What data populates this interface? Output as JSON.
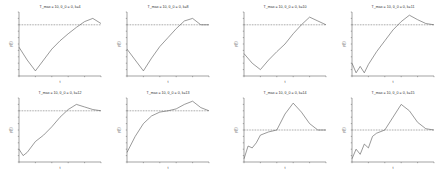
{
  "figure": {
    "rows": 2,
    "cols": 4
  },
  "chart_data": [
    {
      "type": "line",
      "title": "T_max = 10, θ_0 = 0, k=4",
      "xlabel": "t",
      "ylabel": "p(t)",
      "threshold": 0.8,
      "x": [
        0,
        0.1,
        0.2,
        0.3,
        0.4,
        0.5,
        0.6,
        0.7,
        0.8,
        0.9,
        1.0
      ],
      "values": [
        0.45,
        0.25,
        0.08,
        0.25,
        0.42,
        0.55,
        0.66,
        0.76,
        0.85,
        0.9,
        0.82
      ]
    },
    {
      "type": "line",
      "title": "T_max = 10, θ_0 = 0, k=8",
      "xlabel": "t",
      "ylabel": "p(t)",
      "threshold": 0.8,
      "x": [
        0,
        0.1,
        0.2,
        0.3,
        0.4,
        0.5,
        0.6,
        0.7,
        0.8,
        0.9,
        1.0
      ],
      "values": [
        0.42,
        0.25,
        0.08,
        0.28,
        0.46,
        0.6,
        0.74,
        0.86,
        0.9,
        0.8,
        0.8
      ]
    },
    {
      "type": "line",
      "title": "T_max = 10, θ_0 = 0, k=10",
      "xlabel": "t",
      "ylabel": "p(t)",
      "threshold": 0.8,
      "x": [
        0,
        0.1,
        0.2,
        0.3,
        0.4,
        0.5,
        0.6,
        0.7,
        0.8,
        0.9,
        1.0
      ],
      "values": [
        0.35,
        0.2,
        0.1,
        0.25,
        0.38,
        0.5,
        0.66,
        0.8,
        0.92,
        0.86,
        0.8
      ]
    },
    {
      "type": "line",
      "title": "T_max = 10, θ_0 = 0, k=11",
      "xlabel": "t",
      "ylabel": "p(t)",
      "threshold": 0.8,
      "x": [
        0,
        0.05,
        0.1,
        0.15,
        0.2,
        0.3,
        0.4,
        0.5,
        0.6,
        0.7,
        0.8,
        0.9,
        1.0
      ],
      "values": [
        0.2,
        0.05,
        0.15,
        0.05,
        0.18,
        0.38,
        0.55,
        0.72,
        0.85,
        0.95,
        0.88,
        0.82,
        0.8
      ]
    },
    {
      "type": "line",
      "title": "T_max = 10, θ_0 = 0, k=12",
      "xlabel": "t",
      "ylabel": "p(t)",
      "threshold": 0.8,
      "x": [
        0,
        0.05,
        0.1,
        0.2,
        0.3,
        0.4,
        0.5,
        0.6,
        0.7,
        0.8,
        0.9,
        1.0
      ],
      "values": [
        0.2,
        0.1,
        0.15,
        0.32,
        0.42,
        0.55,
        0.7,
        0.82,
        0.9,
        0.86,
        0.82,
        0.8
      ]
    },
    {
      "type": "line",
      "title": "T_max = 10, θ_0 = 0, k=13",
      "xlabel": "t",
      "ylabel": "p(t)",
      "threshold": 0.8,
      "x": [
        0,
        0.1,
        0.2,
        0.3,
        0.4,
        0.5,
        0.6,
        0.7,
        0.8,
        0.9,
        1.0
      ],
      "values": [
        0.15,
        0.4,
        0.6,
        0.72,
        0.78,
        0.8,
        0.83,
        0.9,
        0.95,
        0.85,
        0.8
      ]
    },
    {
      "type": "line",
      "title": "T_max = 10, θ_0 = 0, k=14",
      "xlabel": "t",
      "ylabel": "p(t)",
      "threshold": 0.5,
      "x": [
        0,
        0.05,
        0.1,
        0.15,
        0.2,
        0.3,
        0.4,
        0.5,
        0.6,
        0.7,
        0.8,
        0.9,
        1.0
      ],
      "values": [
        0.05,
        0.25,
        0.22,
        0.3,
        0.42,
        0.47,
        0.5,
        0.75,
        0.92,
        0.78,
        0.6,
        0.5,
        0.5
      ]
    },
    {
      "type": "line",
      "title": "T_max = 10, θ_0 = 0, k=15",
      "xlabel": "t",
      "ylabel": "p(t)",
      "threshold": 0.5,
      "x": [
        0,
        0.05,
        0.1,
        0.15,
        0.2,
        0.25,
        0.3,
        0.4,
        0.5,
        0.6,
        0.7,
        0.8,
        0.9,
        1.0
      ],
      "values": [
        0.05,
        0.2,
        0.12,
        0.28,
        0.22,
        0.4,
        0.45,
        0.5,
        0.7,
        0.9,
        0.8,
        0.62,
        0.52,
        0.5
      ]
    }
  ]
}
